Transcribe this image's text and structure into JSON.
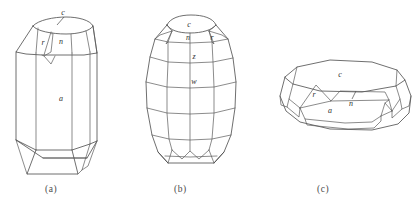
{
  "figure": {
    "background_color": "#ffffff",
    "line_color": "#4a4a4a",
    "label_color": "#2e2e2e",
    "width": 417,
    "height": 208
  },
  "captions": {
    "a": "(a)",
    "b": "(b)",
    "c": "(c)"
  },
  "crystals": [
    {
      "id": "a",
      "caption": "(a)",
      "description": "elongate prismatic crystal, vertical orientation",
      "face_labels": [
        {
          "symbol": "c",
          "x": 66,
          "y": 13
        },
        {
          "symbol": "r",
          "x": 43,
          "y": 44
        },
        {
          "symbol": "n",
          "x": 61,
          "y": 42
        },
        {
          "symbol": "a",
          "x": 61,
          "y": 99
        }
      ]
    },
    {
      "id": "b",
      "caption": "(b)",
      "description": "barrel-shaped crystal with multiple horizontal zones",
      "face_labels": [
        {
          "symbol": "c",
          "x": 189,
          "y": 24
        },
        {
          "symbol": "n",
          "x": 188,
          "y": 36
        },
        {
          "symbol": "r",
          "x": 212,
          "y": 36
        },
        {
          "symbol": "z",
          "x": 194,
          "y": 57
        },
        {
          "symbol": "w",
          "x": 194,
          "y": 81
        }
      ]
    },
    {
      "id": "c",
      "caption": "(c)",
      "description": "tabular crystal lying flat, viewed obliquely",
      "face_labels": [
        {
          "symbol": "c",
          "x": 340,
          "y": 74
        },
        {
          "symbol": "r",
          "x": 313,
          "y": 94
        },
        {
          "symbol": "n",
          "x": 351,
          "y": 103
        },
        {
          "symbol": "a",
          "x": 330,
          "y": 110
        }
      ]
    }
  ]
}
